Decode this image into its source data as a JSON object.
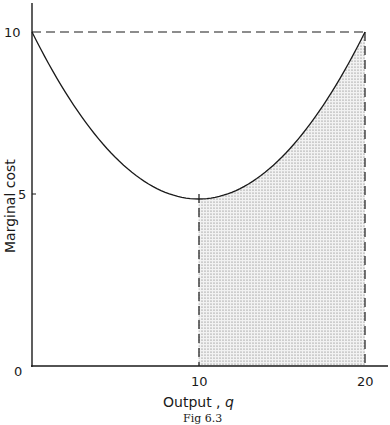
{
  "chart_data": {
    "type": "line",
    "title": "",
    "caption": "Fig 6.3",
    "xlabel": "Output ,",
    "xlabel_var": "q",
    "ylabel": "Marginal cost",
    "xlim": [
      0,
      20
    ],
    "ylim": [
      0,
      10
    ],
    "x_ticks": [
      "0",
      "10",
      "20"
    ],
    "y_ticks": [
      "5",
      "10"
    ],
    "grid": false,
    "legend": null,
    "series": [
      {
        "name": "Marginal cost curve",
        "x": [
          0,
          2,
          4,
          6,
          8,
          10,
          12,
          14,
          16,
          18,
          20
        ],
        "y": [
          10,
          8.2,
          6.8,
          5.8,
          5.2,
          5,
          5.2,
          5.8,
          6.8,
          8.2,
          10
        ]
      }
    ],
    "annotations": [
      {
        "type": "dashed-hline",
        "y": 10,
        "x_from": 0,
        "x_to": 20
      },
      {
        "type": "dashed-vline",
        "x": 20,
        "y_from": 0,
        "y_to": 10
      },
      {
        "type": "dashed-vline",
        "x": 10,
        "y_from": 0,
        "y_to": 5
      },
      {
        "type": "shaded-area",
        "x_from": 10,
        "x_to": 20,
        "under": "Marginal cost curve",
        "pattern": "stipple"
      }
    ]
  },
  "labels": {
    "origin": "0",
    "x10": "10",
    "x20": "20",
    "y5": "5",
    "y10": "10"
  }
}
